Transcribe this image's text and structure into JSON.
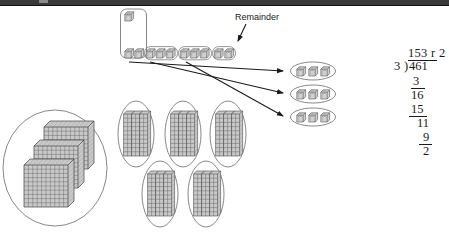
{
  "page": {
    "width": 449,
    "height": 233
  },
  "annotations": {
    "remainder_label": "Remainder"
  },
  "division": {
    "quotient": "153 r 2",
    "divisor": "3",
    "bracket": ")",
    "dividend": "461",
    "step_1": "3",
    "step_2": "16",
    "step_3": "15",
    "step_4": "11",
    "step_5": "9",
    "step_6": "2"
  },
  "blocks": {
    "hundreds_group": {
      "name": "hundreds-flats-circle",
      "flat_count": 3,
      "grid": 10
    },
    "tens_groups": {
      "name": "tens-rods-ovals",
      "oval_count": 5,
      "rods_per_oval": 3
    },
    "ones_row": {
      "name": "ones-cubes-row",
      "cube_count": 11,
      "group_size": 3,
      "group_count": 3,
      "remainder_count": 2
    },
    "ones_result_groups": {
      "name": "ones-cubes-result-ovals",
      "oval_count": 3,
      "cubes_per_oval": 3
    },
    "carry_box": {
      "name": "regroup-bracket",
      "top_cube_count": 1,
      "bottom_cube_count": 2
    }
  },
  "colors": {
    "ink": "#1a1a1a",
    "block_fill": "#c9c9c9",
    "block_line": "#555555",
    "outline": "#555555",
    "topbar": "#3a3a3a"
  }
}
